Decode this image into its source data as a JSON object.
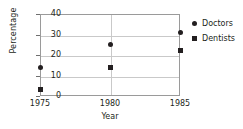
{
  "chart_data": {
    "type": "scatter",
    "title": "",
    "xlabel": "Year",
    "ylabel": "Percentage",
    "x": [
      1975,
      1980,
      1985
    ],
    "categories": [
      "1975",
      "1980",
      "1985"
    ],
    "xtick_labels": [
      "1975",
      "1980",
      "1985"
    ],
    "ytick_labels": [
      "0",
      "10",
      "20",
      "30",
      "40"
    ],
    "ytick_values": [
      0,
      10,
      20,
      30,
      40
    ],
    "ylim": [
      0,
      40
    ],
    "xlim": [
      1975,
      1985
    ],
    "grid": true,
    "legend_position": "right",
    "series": [
      {
        "name": "Doctors",
        "marker": "circle",
        "color": "#231f20",
        "values": [
          14,
          25,
          31
        ]
      },
      {
        "name": "Dentists",
        "marker": "square",
        "color": "#231f20",
        "values": [
          3,
          14,
          22
        ]
      }
    ]
  },
  "legend": {
    "items": [
      {
        "label": "Doctors",
        "marker": "circle"
      },
      {
        "label": "Dentists",
        "marker": "square"
      }
    ]
  }
}
